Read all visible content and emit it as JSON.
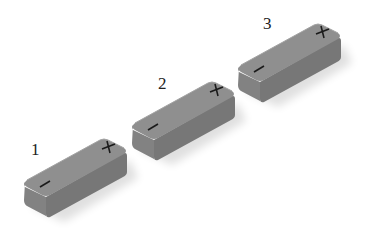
{
  "diagram": {
    "colors": {
      "top_face": "#8c8c8c",
      "front_face": "#7a7a7a",
      "side_face": "#858585",
      "terminal_marks": "#1a1a1a",
      "background": "#ffffff"
    },
    "batteries": [
      {
        "label": "1",
        "negative_symbol": "−",
        "positive_symbol": "+"
      },
      {
        "label": "2",
        "negative_symbol": "−",
        "positive_symbol": "+"
      },
      {
        "label": "3",
        "negative_symbol": "−",
        "positive_symbol": "+"
      }
    ]
  }
}
